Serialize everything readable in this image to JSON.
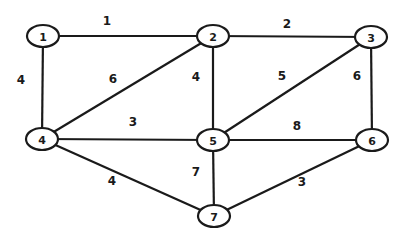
{
  "graph": {
    "type": "weighted-undirected-graph",
    "nodes": [
      {
        "id": "1",
        "label": "1",
        "x": 43,
        "y": 36
      },
      {
        "id": "2",
        "label": "2",
        "x": 213,
        "y": 36
      },
      {
        "id": "3",
        "label": "3",
        "x": 371,
        "y": 37
      },
      {
        "id": "4",
        "label": "4",
        "x": 42,
        "y": 139
      },
      {
        "id": "5",
        "label": "5",
        "x": 213,
        "y": 140
      },
      {
        "id": "6",
        "label": "6",
        "x": 372,
        "y": 140
      },
      {
        "id": "7",
        "label": "7",
        "x": 214,
        "y": 216
      }
    ],
    "edges": [
      {
        "from": "1",
        "to": "2",
        "weight": "1",
        "lx": 107,
        "ly": 21
      },
      {
        "from": "2",
        "to": "3",
        "weight": "2",
        "lx": 287,
        "ly": 24
      },
      {
        "from": "1",
        "to": "4",
        "weight": "4",
        "lx": 21,
        "ly": 80
      },
      {
        "from": "2",
        "to": "4",
        "weight": "6",
        "lx": 113,
        "ly": 79
      },
      {
        "from": "2",
        "to": "5",
        "weight": "4",
        "lx": 196,
        "ly": 77
      },
      {
        "from": "3",
        "to": "5",
        "weight": "5",
        "lx": 282,
        "ly": 76
      },
      {
        "from": "3",
        "to": "6",
        "weight": "6",
        "lx": 357,
        "ly": 76
      },
      {
        "from": "4",
        "to": "5",
        "weight": "3",
        "lx": 133,
        "ly": 122
      },
      {
        "from": "5",
        "to": "6",
        "weight": "8",
        "lx": 297,
        "ly": 126
      },
      {
        "from": "4",
        "to": "7",
        "weight": "4",
        "lx": 112,
        "ly": 181
      },
      {
        "from": "5",
        "to": "7",
        "weight": "7",
        "lx": 196,
        "ly": 172
      },
      {
        "from": "6",
        "to": "7",
        "weight": "3",
        "lx": 302,
        "ly": 182
      }
    ]
  }
}
